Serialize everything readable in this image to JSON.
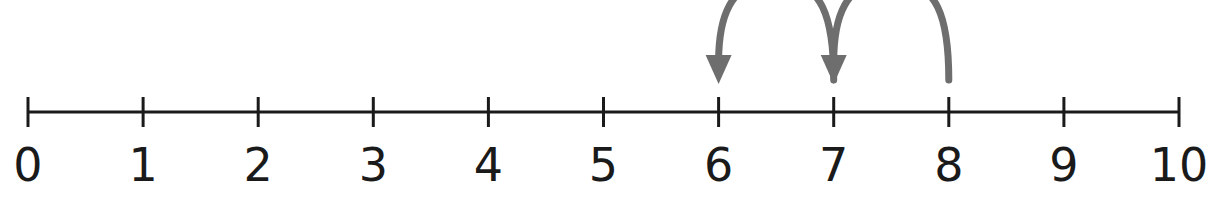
{
  "number_line": {
    "min": 0,
    "max": 10,
    "tick_labels": [
      "0",
      "1",
      "2",
      "3",
      "4",
      "5",
      "6",
      "7",
      "8",
      "9",
      "10"
    ],
    "line_color": "#1a1a1a"
  },
  "jumps": [
    {
      "from": 8,
      "to": 7
    },
    {
      "from": 7,
      "to": 6
    }
  ],
  "arrow_color": "#6e6e6e"
}
